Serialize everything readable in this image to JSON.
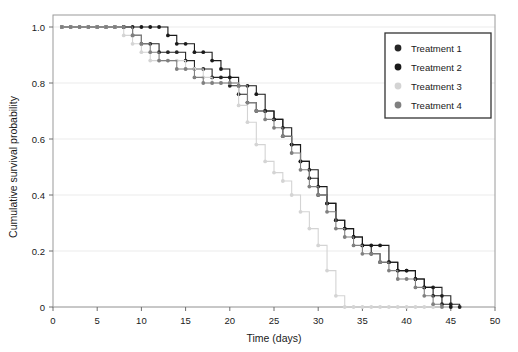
{
  "chart_data": {
    "type": "line",
    "title": "",
    "subtitle": "",
    "xlabel": "Time (days)",
    "ylabel": "Cumulative survival probability",
    "xlim": [
      0,
      50
    ],
    "ylim": [
      0,
      1.0
    ],
    "xticks": [
      0,
      5,
      10,
      15,
      20,
      25,
      30,
      35,
      40,
      45,
      50
    ],
    "xtick_labels": [
      "0",
      "5",
      "10",
      "15",
      "20",
      "25",
      "30",
      "35",
      "40",
      "45",
      "50"
    ],
    "yticks": [
      0,
      0.2,
      0.4,
      0.6,
      0.8,
      1.0
    ],
    "ytick_labels": [
      "0",
      "0.2",
      "0.4",
      "0.6",
      "0.8",
      "1.0"
    ],
    "grid": "horizontal",
    "legend_position": "top-right",
    "marker": "circle",
    "step_style": "kaplan-meier",
    "series": [
      {
        "name": "Treatment 1",
        "color": "#262626",
        "x": [
          1,
          2,
          3,
          4,
          5,
          6,
          7,
          8,
          9,
          10,
          11,
          12,
          13,
          14,
          15,
          16,
          17,
          18,
          19,
          20,
          21,
          22,
          23,
          24,
          25,
          26,
          27,
          28,
          29,
          30,
          31,
          32,
          33,
          34,
          35,
          36,
          37,
          38,
          39,
          40,
          41,
          42,
          43,
          44,
          45,
          46
        ],
        "y": [
          1.0,
          1.0,
          1.0,
          1.0,
          1.0,
          1.0,
          1.0,
          1.0,
          0.97,
          0.94,
          0.94,
          0.91,
          0.91,
          0.91,
          0.88,
          0.85,
          0.85,
          0.82,
          0.82,
          0.79,
          0.76,
          0.73,
          0.7,
          0.7,
          0.67,
          0.61,
          0.58,
          0.52,
          0.46,
          0.4,
          0.37,
          0.31,
          0.28,
          0.25,
          0.22,
          0.19,
          0.16,
          0.16,
          0.13,
          0.13,
          0.1,
          0.07,
          0.07,
          0.04,
          0.01,
          0.0
        ]
      },
      {
        "name": "Treatment 2",
        "color": "#1a1a1a",
        "x": [
          1,
          2,
          3,
          4,
          5,
          6,
          7,
          8,
          9,
          10,
          11,
          12,
          13,
          14,
          15,
          16,
          17,
          18,
          19,
          20,
          21,
          22,
          23,
          24,
          25,
          26,
          27,
          28,
          29,
          30,
          31,
          32,
          33,
          34,
          35,
          36,
          37,
          38,
          39,
          40,
          41,
          42,
          43,
          44,
          45
        ],
        "y": [
          1.0,
          1.0,
          1.0,
          1.0,
          1.0,
          1.0,
          1.0,
          1.0,
          1.0,
          1.0,
          1.0,
          1.0,
          0.97,
          0.94,
          0.94,
          0.91,
          0.91,
          0.88,
          0.85,
          0.82,
          0.79,
          0.79,
          0.76,
          0.7,
          0.67,
          0.64,
          0.58,
          0.52,
          0.49,
          0.43,
          0.37,
          0.31,
          0.28,
          0.25,
          0.22,
          0.22,
          0.22,
          0.16,
          0.13,
          0.13,
          0.1,
          0.07,
          0.04,
          0.01,
          0.0
        ]
      },
      {
        "name": "Treatment 3",
        "color": "#d4d4d4",
        "x": [
          1,
          2,
          3,
          4,
          5,
          6,
          7,
          8,
          9,
          10,
          11,
          12,
          13,
          14,
          15,
          16,
          17,
          18,
          19,
          20,
          21,
          22,
          23,
          24,
          25,
          26,
          27,
          28,
          29,
          30,
          31,
          32,
          33,
          34,
          35,
          36,
          37,
          38,
          39,
          40,
          41,
          42,
          43
        ],
        "y": [
          1.0,
          1.0,
          1.0,
          1.0,
          1.0,
          1.0,
          1.0,
          0.97,
          0.94,
          0.91,
          0.88,
          0.88,
          0.88,
          0.88,
          0.85,
          0.85,
          0.82,
          0.8,
          0.8,
          0.8,
          0.72,
          0.66,
          0.58,
          0.52,
          0.48,
          0.45,
          0.4,
          0.34,
          0.28,
          0.22,
          0.13,
          0.04,
          0.0,
          0.0,
          0.0,
          0.0,
          0.0,
          0.0,
          0.0,
          0.0,
          0.0,
          0.0,
          0.0
        ]
      },
      {
        "name": "Treatment 4",
        "color": "#808080",
        "x": [
          1,
          2,
          3,
          4,
          5,
          6,
          7,
          8,
          9,
          10,
          11,
          12,
          13,
          14,
          15,
          16,
          17,
          18,
          19,
          20,
          21,
          22,
          23,
          24,
          25,
          26,
          27,
          28,
          29,
          30,
          31,
          32,
          33,
          34,
          35,
          36,
          37,
          38,
          39,
          40,
          41,
          42,
          43,
          44
        ],
        "y": [
          1.0,
          1.0,
          1.0,
          1.0,
          1.0,
          1.0,
          1.0,
          1.0,
          0.97,
          0.94,
          0.91,
          0.88,
          0.88,
          0.85,
          0.85,
          0.82,
          0.8,
          0.8,
          0.8,
          0.8,
          0.79,
          0.73,
          0.7,
          0.67,
          0.64,
          0.61,
          0.55,
          0.49,
          0.43,
          0.4,
          0.34,
          0.28,
          0.25,
          0.22,
          0.19,
          0.19,
          0.16,
          0.13,
          0.1,
          0.1,
          0.07,
          0.04,
          0.01,
          0.0
        ]
      }
    ]
  },
  "legend": {
    "items": [
      {
        "label": "Treatment 1"
      },
      {
        "label": "Treatment 2"
      },
      {
        "label": "Treatment 3"
      },
      {
        "label": "Treatment 4"
      }
    ]
  },
  "colors": {
    "background": "#ffffff",
    "plot_border": "#9a9a9a",
    "gridline": "#ebebeb",
    "axis": "#6e6e6e",
    "text": "#1a1a1a",
    "legend_border": "#333333"
  }
}
